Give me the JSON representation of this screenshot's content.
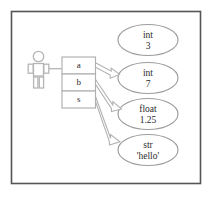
{
  "diagram": {
    "frame": {
      "border_color": "#555555",
      "background_color": "#ffffff"
    },
    "stroke_color": "#a9a9a9",
    "text_color": "#2b2b2b",
    "actor": {
      "icon": "person-stick-figure-icon",
      "label": ""
    },
    "variables": {
      "box_label": "variable slots",
      "slots": [
        {
          "name": "a",
          "points_to": "int 7"
        },
        {
          "name": "b",
          "points_to": "float 1.25"
        },
        {
          "name": "s",
          "points_to": "str 'hello'"
        }
      ]
    },
    "objects": [
      {
        "type": "int",
        "value": "3",
        "referenced": false
      },
      {
        "type": "int",
        "value": "7",
        "referenced": true
      },
      {
        "type": "float",
        "value": "1.25",
        "referenced": true
      },
      {
        "type": "str",
        "value": "'hello'",
        "referenced": true
      }
    ],
    "arrows": [
      {
        "from": "a",
        "to": "int 7"
      },
      {
        "from": "b",
        "to": "float 1.25"
      },
      {
        "from": "s",
        "to": "str 'hello'"
      },
      {
        "from": "actor",
        "to": "variable-box"
      }
    ]
  }
}
